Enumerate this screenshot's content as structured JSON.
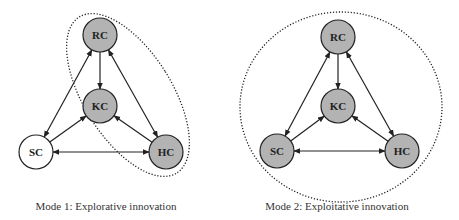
{
  "colors": {
    "node_filled": "#b3b3b3",
    "node_empty": "#ffffff",
    "stroke": "#222222",
    "boundary": "#222222"
  },
  "diagrams": [
    {
      "id": "mode1",
      "caption": "Mode 1: Explorative innovation",
      "nodes": [
        {
          "id": "RC",
          "label": "RC",
          "filled": true
        },
        {
          "id": "KC",
          "label": "KC",
          "filled": true
        },
        {
          "id": "SC",
          "label": "SC",
          "filled": false
        },
        {
          "id": "HC",
          "label": "HC",
          "filled": true
        }
      ],
      "edges": [
        {
          "from": "RC",
          "to": "KC",
          "bidirectional": false
        },
        {
          "from": "RC",
          "to": "SC",
          "bidirectional": true
        },
        {
          "from": "RC",
          "to": "HC",
          "bidirectional": true
        },
        {
          "from": "SC",
          "to": "KC",
          "bidirectional": false
        },
        {
          "from": "HC",
          "to": "KC",
          "bidirectional": false
        },
        {
          "from": "SC",
          "to": "HC",
          "bidirectional": true
        }
      ],
      "boundary_encloses": [
        "RC",
        "KC",
        "HC"
      ],
      "boundary_style": "dotted"
    },
    {
      "id": "mode2",
      "caption": "Mode 2: Exploitative innovation",
      "nodes": [
        {
          "id": "RC",
          "label": "RC",
          "filled": true
        },
        {
          "id": "KC",
          "label": "KC",
          "filled": true
        },
        {
          "id": "SC",
          "label": "SC",
          "filled": true
        },
        {
          "id": "HC",
          "label": "HC",
          "filled": true
        }
      ],
      "edges": [
        {
          "from": "RC",
          "to": "KC",
          "bidirectional": false
        },
        {
          "from": "RC",
          "to": "SC",
          "bidirectional": true
        },
        {
          "from": "RC",
          "to": "HC",
          "bidirectional": true
        },
        {
          "from": "SC",
          "to": "KC",
          "bidirectional": false
        },
        {
          "from": "HC",
          "to": "KC",
          "bidirectional": false
        },
        {
          "from": "SC",
          "to": "HC",
          "bidirectional": true
        }
      ],
      "boundary_encloses": [
        "RC",
        "KC",
        "SC",
        "HC"
      ],
      "boundary_style": "dotted"
    }
  ]
}
